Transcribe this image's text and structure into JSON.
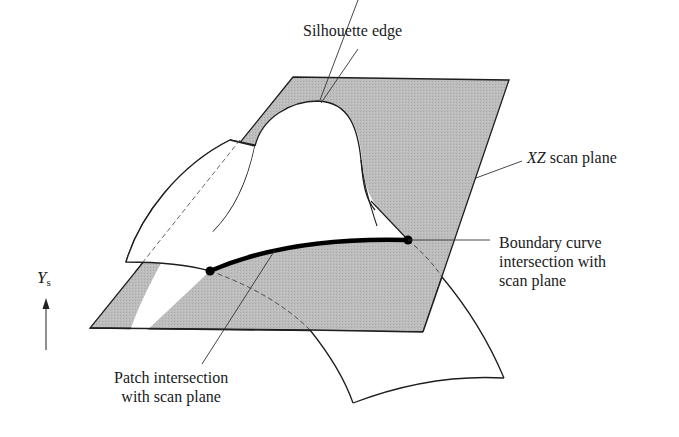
{
  "figure": {
    "colors": {
      "scan_plane_fill": "#b9b9b9",
      "outline": "#1e1e1e",
      "background": "#ffffff"
    },
    "labels": {
      "silhouette_edge": "Silhouette edge",
      "xz_plane_italic": "XZ",
      "xz_plane_rest": " scan plane",
      "boundary_curve_line1": "Boundary curve",
      "boundary_curve_line2": "intersection with",
      "boundary_curve_line3": "scan plane",
      "patch_intersection_line1": "Patch intersection",
      "patch_intersection_line2": "with scan plane",
      "axis_symbol": "Y",
      "axis_subscript": "s"
    }
  }
}
